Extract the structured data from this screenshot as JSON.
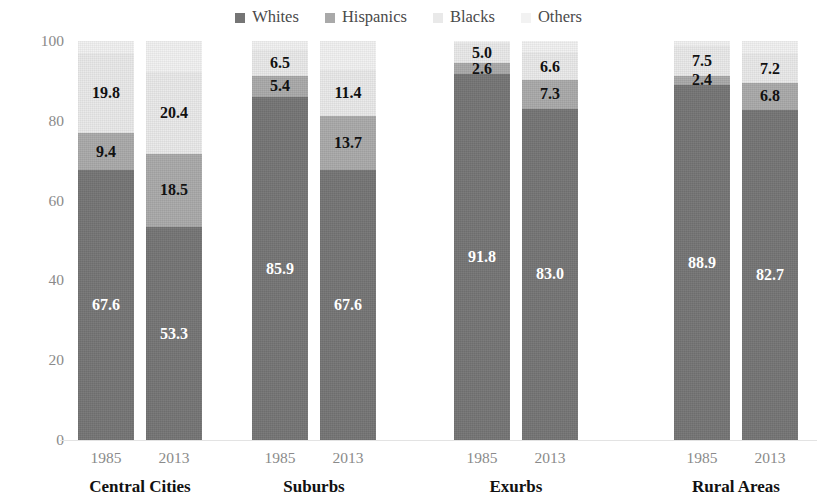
{
  "legend": {
    "position": "top-center",
    "items": [
      {
        "label": "Whites",
        "color": "#757575",
        "key": "whites"
      },
      {
        "label": "Hispanics",
        "color": "#a9a9a9",
        "key": "hispanics"
      },
      {
        "label": "Blacks",
        "color": "#e9e9e9",
        "key": "blacks"
      },
      {
        "label": "Others",
        "color": "#f2f2f2",
        "key": "others"
      }
    ]
  },
  "axes": {
    "ylabel": "Percent of Householders",
    "yticks": [
      "100",
      "80",
      "60",
      "40",
      "20",
      "0"
    ],
    "ylim": [
      0,
      100
    ]
  },
  "groups": [
    {
      "name": "Central Cities",
      "bars": [
        {
          "year": "1985",
          "whites": "67.6",
          "hispanics": "9.4",
          "blacks": "19.8",
          "others": ""
        },
        {
          "year": "2013",
          "whites": "53.3",
          "hispanics": "18.5",
          "blacks": "20.4",
          "others": ""
        }
      ]
    },
    {
      "name": "Suburbs",
      "bars": [
        {
          "year": "1985",
          "whites": "85.9",
          "hispanics": "5.4",
          "blacks": "6.5",
          "others": ""
        },
        {
          "year": "2013",
          "whites": "67.6",
          "hispanics": "13.7",
          "blacks": "11.4",
          "others": ""
        }
      ]
    },
    {
      "name": "Exurbs",
      "bars": [
        {
          "year": "1985",
          "whites": "91.8",
          "hispanics": "2.6",
          "blacks": "5.0",
          "others": ""
        },
        {
          "year": "2013",
          "whites": "83.0",
          "hispanics": "7.3",
          "blacks": "6.6",
          "others": ""
        }
      ]
    },
    {
      "name": "Rural Areas",
      "bars": [
        {
          "year": "1985",
          "whites": "88.9",
          "hispanics": "2.4",
          "blacks": "7.5",
          "others": ""
        },
        {
          "year": "2013",
          "whites": "82.7",
          "hispanics": "6.8",
          "blacks": "7.2",
          "others": ""
        }
      ]
    }
  ],
  "chart_data": {
    "type": "bar",
    "subtype": "stacked-100-percent",
    "title": "",
    "xlabel": "",
    "ylabel": "Percent of Householders",
    "ylim": [
      0,
      100
    ],
    "yticks": [
      0,
      20,
      40,
      60,
      80,
      100
    ],
    "grid": false,
    "legend_position": "top-center",
    "stack_order_bottom_to_top": [
      "Whites",
      "Hispanics",
      "Blacks",
      "Others"
    ],
    "categories": [
      "Central Cities 1985",
      "Central Cities 2013",
      "Suburbs 1985",
      "Suburbs 2013",
      "Exurbs 1985",
      "Exurbs 2013",
      "Rural Areas 1985",
      "Rural Areas 2013"
    ],
    "group_names": [
      "Central Cities",
      "Suburbs",
      "Exurbs",
      "Rural Areas"
    ],
    "years": [
      "1985",
      "2013"
    ],
    "series": [
      {
        "name": "Whites",
        "color": "#757575",
        "values": [
          67.6,
          53.3,
          85.9,
          67.6,
          91.8,
          83.0,
          88.9,
          82.7
        ]
      },
      {
        "name": "Hispanics",
        "color": "#a9a9a9",
        "values": [
          9.4,
          18.5,
          5.4,
          13.7,
          2.6,
          7.3,
          2.4,
          6.8
        ]
      },
      {
        "name": "Blacks",
        "color": "#e9e9e9",
        "values": [
          19.8,
          20.4,
          6.5,
          11.4,
          5.0,
          6.6,
          7.5,
          7.2
        ]
      },
      {
        "name": "Others",
        "color": "#f2f2f2",
        "values": [
          3.2,
          7.8,
          2.2,
          7.3,
          0.6,
          3.1,
          1.2,
          3.3
        ]
      }
    ],
    "data_labels_shown": [
      "Whites",
      "Hispanics",
      "Blacks"
    ]
  }
}
